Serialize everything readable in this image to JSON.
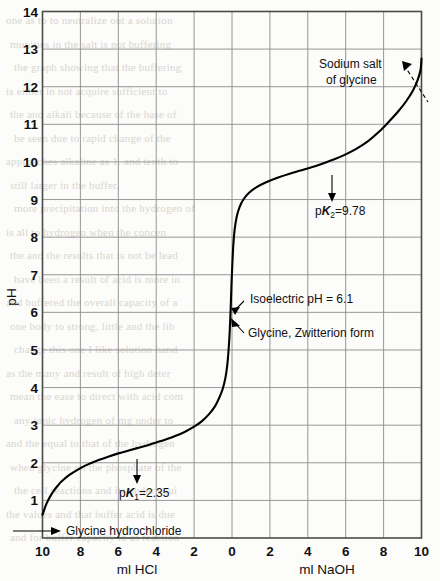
{
  "figure": {
    "kind": "titration-curve",
    "background_color": "#fcfcfa",
    "ink_color": "#000000",
    "grid_color": "#8b8b8b"
  },
  "axes": {
    "y_title": "pH",
    "y_ticks": [
      "14",
      "13",
      "12",
      "11",
      "10",
      "9",
      "8",
      "7",
      "6",
      "5",
      "4",
      "3",
      "2",
      "1"
    ],
    "x_left_title": "ml HCl",
    "x_right_title": "ml NaOH",
    "x_ticks": [
      "10",
      "8",
      "6",
      "4",
      "2",
      "0",
      "2",
      "4",
      "6",
      "8",
      "10"
    ]
  },
  "annotations": {
    "sodium_salt_line1": "Sodium salt",
    "sodium_salt_line2": "of glycine",
    "pk2_prefix": "p",
    "pk2_k": "K",
    "pk2_sub": "2",
    "pk2_value": "=9.78",
    "isoelectric": "Isoelectric pH = 6.1",
    "zwitterion": "Glycine, Zwitterion form",
    "pk1_prefix": "p",
    "pk1_k": "K",
    "pk1_sub": "1",
    "pk1_value": "=2.35",
    "glycine_hydrochloride": "Glycine hydrochloride"
  },
  "bleed_text": [
    "one as to to neutralize out a solution",
    "munities in the salt is not buffering",
    "the graph showing that the buffering",
    "is either in not acquire sufficient to",
    "the and alkali because of the base of",
    "be seen due to rapid change of the",
    "approaches alkaline as 1. and tenth to",
    "still larger in the buffer.",
    "more precipitation into the hydrogen of",
    "is all to hydrogen when the concen",
    "the and the results that is not be lead",
    "have been a result of acid is more in",
    "and buffered the overall capacity of a",
    "one body to strong, little and the lib",
    "change this one I like solution hand",
    "as the many and result of high deter",
    "mean the ease to direct with acid com",
    "any ionic hydrogen of mg under to",
    "and the equal to that of the hydrogen",
    "when glycine on the phosphate of the",
    "the cell reactions and its under equi",
    "the values and that buffer acid is due",
    "and for buffer capacity to as reaction"
  ],
  "chart_data": {
    "type": "line",
    "xlabel_left": "ml HCl",
    "xlabel_right": "ml NaOH",
    "ylabel": "pH",
    "xlim": [
      -10,
      10
    ],
    "ylim": [
      0,
      14
    ],
    "grid": true,
    "x_tick_values": [
      -10,
      -8,
      -6,
      -4,
      -2,
      0,
      2,
      4,
      6,
      8,
      10
    ],
    "x_tick_labels": [
      "10",
      "8",
      "6",
      "4",
      "2",
      "0",
      "2",
      "4",
      "6",
      "8",
      "10"
    ],
    "y_tick_values": [
      1,
      2,
      3,
      4,
      5,
      6,
      7,
      8,
      9,
      10,
      11,
      12,
      13,
      14
    ],
    "series": [
      {
        "name": "glycine titration",
        "comment": "x = ml of titrant; negative = ml HCl added, positive = ml NaOH added. y = pH",
        "points": [
          [
            -10.0,
            0.62
          ],
          [
            -9.8,
            0.9
          ],
          [
            -9.6,
            1.1
          ],
          [
            -9.4,
            1.26
          ],
          [
            -9.2,
            1.39
          ],
          [
            -9.0,
            1.5
          ],
          [
            -8.6,
            1.67
          ],
          [
            -8.2,
            1.8
          ],
          [
            -7.8,
            1.91
          ],
          [
            -7.4,
            2.0
          ],
          [
            -7.0,
            2.08
          ],
          [
            -6.5,
            2.17
          ],
          [
            -6.0,
            2.25
          ],
          [
            -5.5,
            2.32
          ],
          [
            -5.0,
            2.39
          ],
          [
            -4.5,
            2.46
          ],
          [
            -4.0,
            2.54
          ],
          [
            -3.5,
            2.62
          ],
          [
            -3.0,
            2.71
          ],
          [
            -2.5,
            2.82
          ],
          [
            -2.0,
            2.96
          ],
          [
            -1.6,
            3.1
          ],
          [
            -1.2,
            3.3
          ],
          [
            -0.9,
            3.5
          ],
          [
            -0.7,
            3.7
          ],
          [
            -0.5,
            3.95
          ],
          [
            -0.35,
            4.25
          ],
          [
            -0.25,
            4.6
          ],
          [
            -0.18,
            5.0
          ],
          [
            -0.12,
            5.5
          ],
          [
            -0.07,
            6.1
          ],
          [
            -0.03,
            6.7
          ],
          [
            0.02,
            7.3
          ],
          [
            0.07,
            7.8
          ],
          [
            0.14,
            8.2
          ],
          [
            0.25,
            8.55
          ],
          [
            0.4,
            8.8
          ],
          [
            0.6,
            9.0
          ],
          [
            0.9,
            9.18
          ],
          [
            1.3,
            9.33
          ],
          [
            1.8,
            9.46
          ],
          [
            2.4,
            9.58
          ],
          [
            3.0,
            9.68
          ],
          [
            3.6,
            9.77
          ],
          [
            4.2,
            9.86
          ],
          [
            4.8,
            9.96
          ],
          [
            5.4,
            10.07
          ],
          [
            6.0,
            10.2
          ],
          [
            6.6,
            10.36
          ],
          [
            7.2,
            10.56
          ],
          [
            7.8,
            10.82
          ],
          [
            8.3,
            11.08
          ],
          [
            8.8,
            11.36
          ],
          [
            9.2,
            11.62
          ],
          [
            9.55,
            11.9
          ],
          [
            9.8,
            12.18
          ],
          [
            9.95,
            12.45
          ],
          [
            10.0,
            12.75
          ]
        ]
      }
    ],
    "markers": [
      {
        "label": "pK1=2.35",
        "x": -5.0,
        "y": 2.35
      },
      {
        "label": "pK2=9.78",
        "x": 4.3,
        "y": 9.78
      },
      {
        "label": "Isoelectric pH = 6.1",
        "x": -0.07,
        "y": 6.1
      },
      {
        "label": "Glycine, Zwitterion form",
        "x": -0.07,
        "y": 6.1
      },
      {
        "label": "Glycine hydrochloride",
        "x": -10.0,
        "y": 0.62
      },
      {
        "label": "Sodium salt of glycine",
        "x": 9.6,
        "y": 12.0
      }
    ]
  }
}
